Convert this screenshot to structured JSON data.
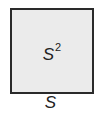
{
  "diagram": {
    "shape": "square",
    "area_label": {
      "base": "S",
      "exponent": "2"
    },
    "side_label": "S",
    "colors": {
      "fill": "#ebebeb",
      "stroke": "#2a2a2a",
      "text": "#222222"
    }
  }
}
